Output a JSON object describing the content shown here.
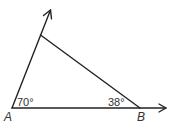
{
  "diagram": {
    "type": "triangle-with-rays",
    "stroke_color": "#222222",
    "vertices": {
      "A": {
        "label": "A",
        "x": 12,
        "y": 108
      },
      "B": {
        "label": "B",
        "x": 140,
        "y": 108
      },
      "C": {
        "label": "",
        "x": 40.5,
        "y": 35
      }
    },
    "rays": [
      {
        "from": "A",
        "through": "C",
        "tip": {
          "x": 50.5,
          "y": 10
        }
      },
      {
        "from": "A",
        "through": "B",
        "tip": {
          "x": 166,
          "y": 108
        }
      }
    ],
    "angles": [
      {
        "vertex": "A",
        "value": "70°"
      },
      {
        "vertex": "B",
        "value": "38°"
      }
    ]
  }
}
